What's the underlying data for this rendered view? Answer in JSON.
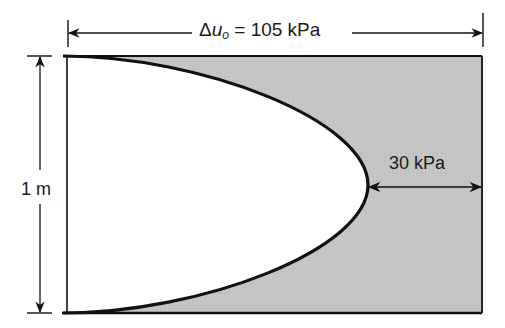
{
  "figure": {
    "type": "excess pore pressure isochrone diagram",
    "top_dimension": {
      "symbol": "Δ",
      "variable": "u",
      "subscript": "o",
      "equals": " = ",
      "value": "105 kPa"
    },
    "left_dimension": {
      "label": "1 m"
    },
    "right_dimension": {
      "label": "30 kPa"
    },
    "colors": {
      "shaded_region": "#c3c3c3",
      "lines": "#111111",
      "background": "#ffffff"
    }
  }
}
